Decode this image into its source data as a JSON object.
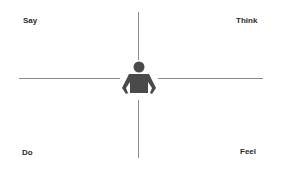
{
  "diagram": {
    "type": "empathy-map",
    "quadrants": {
      "top_left": "Say",
      "top_right": "Think",
      "bottom_left": "Do",
      "bottom_right": "Feel"
    },
    "center_icon": "person-icon",
    "colors": {
      "lines": "#8a8a8a",
      "figure": "#4a4a4a",
      "text": "#2b2b2b"
    }
  }
}
